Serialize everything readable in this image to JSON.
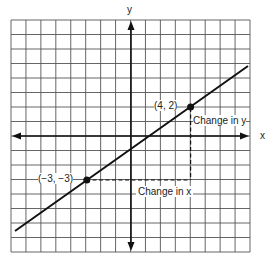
{
  "chart_data": {
    "type": "line",
    "title": "",
    "xlabel": "x",
    "ylabel": "y",
    "xlim": [
      -8,
      8
    ],
    "ylim": [
      -8,
      8
    ],
    "grid": true,
    "series": [
      {
        "name": "line",
        "x": [
          -8,
          8
        ],
        "y": [
          -6.57,
          4.86
        ]
      }
    ],
    "points": [
      {
        "label": "(4, 2)",
        "x": 4,
        "y": 2
      },
      {
        "label": "(-3, -3)",
        "x": -3,
        "y": -3
      }
    ],
    "annotations": [
      {
        "text": "Change in y",
        "from": [
          4,
          -3
        ],
        "to": [
          4,
          2
        ]
      },
      {
        "text": "Change in x",
        "from": [
          -3,
          -3
        ],
        "to": [
          4,
          -3
        ]
      }
    ]
  },
  "labels": {
    "y_axis": "y",
    "x_axis": "x",
    "point_a": "(4, 2)",
    "point_b": "(−3, −3)",
    "change_y": "Change in y",
    "change_x": "Change in x"
  }
}
